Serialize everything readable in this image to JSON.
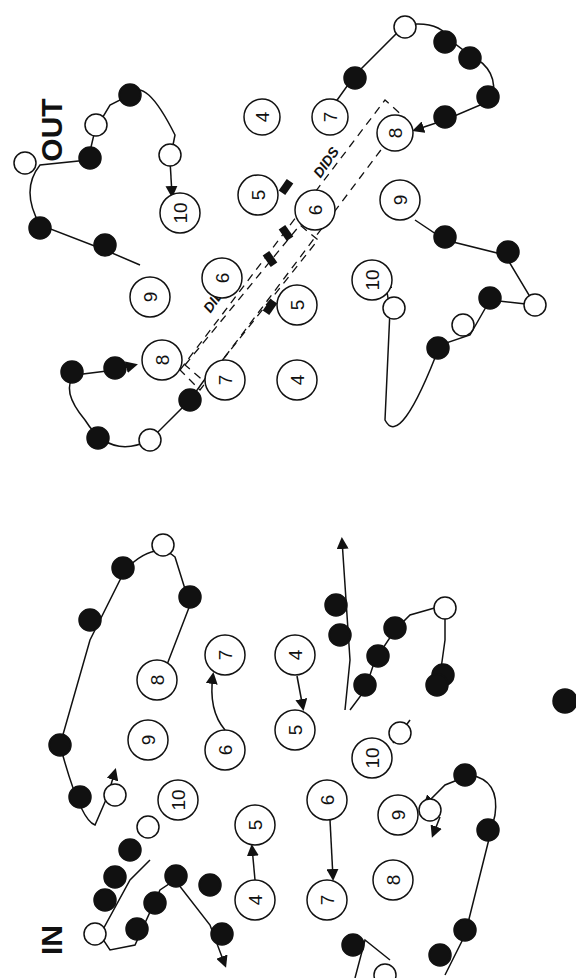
{
  "figure": {
    "colors": {
      "ink": "#111111",
      "background": "#ffffff",
      "open_residue": "#ffffff",
      "filled_residue": "#111111"
    }
  },
  "panels": {
    "out": {
      "state_label": "OUT",
      "dids_labels": [
        "DIDS",
        "DIDS"
      ],
      "helices_upper": [
        "4",
        "5",
        "6",
        "7",
        "8",
        "9",
        "10"
      ],
      "helices_lower": [
        "4",
        "5",
        "6",
        "7",
        "8",
        "9",
        "10"
      ]
    },
    "in": {
      "state_label": "IN",
      "helices_upper": [
        "4",
        "5",
        "6",
        "7",
        "8",
        "9",
        "10"
      ],
      "helices_lower": [
        "4",
        "5",
        "6",
        "7",
        "8",
        "9",
        "10"
      ]
    }
  },
  "labels": {
    "out_4a": "4",
    "out_7a": "7",
    "out_8a": "8",
    "out_5a": "5",
    "out_6a": "6",
    "out_9a": "9",
    "out_10a": "10",
    "out_4b": "4",
    "out_7b": "7",
    "out_8b": "8",
    "out_5b": "5",
    "out_6b": "6",
    "out_9b": "9",
    "out_10b": "10",
    "in_8a": "8",
    "in_7a": "7",
    "in_4a": "4",
    "in_9a": "9",
    "in_6a": "6",
    "in_5a": "5",
    "in_10a": "10",
    "in_10b": "10",
    "in_5b": "5",
    "in_6b": "6",
    "in_9b": "9",
    "in_4b": "4",
    "in_7b": "7",
    "in_8b": "8",
    "out": "OUT",
    "in": "IN",
    "dids1": "DIDS",
    "dids2": "DIDS"
  }
}
